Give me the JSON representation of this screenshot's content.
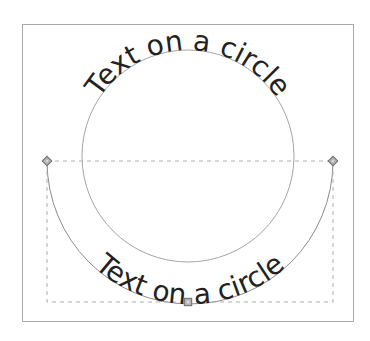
{
  "canvas": {
    "texts": {
      "top": "Text on a circle",
      "bottom": "Text on a circle"
    },
    "selection": {
      "handle_shapes": {
        "left": "diamond",
        "right": "diamond",
        "bottom_center": "square"
      }
    }
  },
  "colors": {
    "frame_border": "#a9a9a9",
    "circle_stroke": "#9b9b9b",
    "arc_stroke": "#8c8c8c",
    "selection_dash": "#aeaeae",
    "text_color": "#222222",
    "handle_fill": "#b2b2b2",
    "handle_stroke": "#6f6f6f",
    "handle_inner": "#dcdcdc"
  }
}
